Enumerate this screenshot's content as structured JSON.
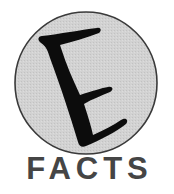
{
  "logo": {
    "letter": "E",
    "wordmark": "FACTS",
    "colors": {
      "circle_fill": "#d2d2d2",
      "circle_stroke": "#3a3a3a",
      "letter": "#0c0c0c",
      "wordmark": "#454545",
      "background": "#ffffff"
    }
  }
}
